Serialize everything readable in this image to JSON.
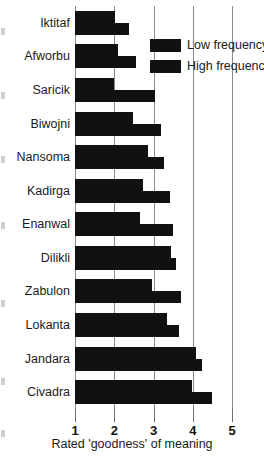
{
  "chart_data": {
    "type": "bar",
    "orientation": "horizontal",
    "title": "",
    "xlabel": "Rated 'goodness' of meaning",
    "ylabel": "",
    "xlim": [
      1,
      5
    ],
    "xticks": [
      1,
      2,
      3,
      4,
      5
    ],
    "xtick_labels": [
      "1",
      "2",
      "3",
      "4",
      "5"
    ],
    "grid": true,
    "grid_axis": "x",
    "legend_position": "upper right inside",
    "categories": [
      "Iktitaf",
      "Afworbu",
      "Saricik",
      "Biwojni",
      "Nansoma",
      "Kadirga",
      "Enanwal",
      "Dilikli",
      "Zabulon",
      "Lokanta",
      "Jandara",
      "Civadra"
    ],
    "series": [
      {
        "name": "Low frequency",
        "color": "#111111",
        "values": [
          2.03,
          2.1,
          2.0,
          2.47,
          2.86,
          2.72,
          2.66,
          3.44,
          2.95,
          3.34,
          4.08,
          3.97
        ]
      },
      {
        "name": "High frequency",
        "color": "#111111",
        "values": [
          2.38,
          2.55,
          3.05,
          3.2,
          3.26,
          3.42,
          3.5,
          3.58,
          3.7,
          3.64,
          4.24,
          4.5
        ]
      }
    ]
  },
  "legend": {
    "items": [
      {
        "label": "Low frequency"
      },
      {
        "label": "High frequency"
      }
    ]
  },
  "axis": {
    "x_title": "Rated 'goodness' of meaning"
  }
}
